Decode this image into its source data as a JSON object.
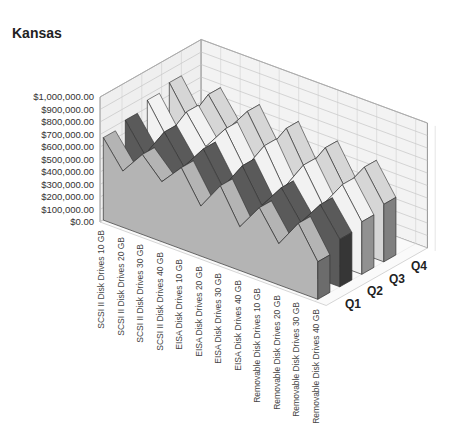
{
  "chart_data": {
    "type": "area",
    "subtype": "3d-area",
    "title": "Kansas",
    "xlabel": "",
    "ylabel": "",
    "zlabel": "",
    "ylim": [
      0,
      1000000
    ],
    "yticks": [
      "$1,000,000.00",
      "$900,000.00",
      "$800,000.00",
      "$700,000.00",
      "$600,000.00",
      "$500,000.00",
      "$400,000.00",
      "$300,000.00",
      "$200,000.00",
      "$100,000.00",
      "$0.00"
    ],
    "categories": [
      "SCSI II Disk Drives 10 GB",
      "SCSI II Disk Drives 20 GB",
      "SCSI II Disk Drives 30 GB",
      "SCSI II Disk Drives 40 GB",
      "EISA Disk Drives 10 GB",
      "EISA Disk Drives 20 GB",
      "EISA Disk Drives 30 GB",
      "EISA Disk Drives 40 GB",
      "Removable Disk Drives 10 GB",
      "Removable Disk Drives 20 GB",
      "Removable Disk Drives 30 GB",
      "Removable Disk Drives 40 GB"
    ],
    "series": [
      {
        "name": "Q1",
        "color": "#b4b4b4",
        "values": [
          660000,
          450000,
          640000,
          480000,
          650000,
          400000,
          620000,
          350000,
          560000,
          330000,
          550000,
          300000
        ]
      },
      {
        "name": "Q2",
        "color": "#5a5a5a",
        "values": [
          700000,
          480000,
          720000,
          500000,
          700000,
          450000,
          680000,
          420000,
          620000,
          400000,
          600000,
          380000
        ]
      },
      {
        "name": "Q3",
        "color": "#f2f2f2",
        "values": [
          760000,
          520000,
          780000,
          560000,
          760000,
          500000,
          740000,
          460000,
          700000,
          440000,
          660000,
          420000
        ]
      },
      {
        "name": "Q4",
        "color": "#d6d6d6",
        "values": [
          800000,
          560000,
          820000,
          600000,
          800000,
          540000,
          780000,
          500000,
          740000,
          480000,
          700000,
          460000
        ]
      }
    ],
    "grid": true,
    "legend": "none",
    "depth_labels": [
      "Q1",
      "Q2",
      "Q3",
      "Q4"
    ]
  },
  "page": {
    "title": "Kansas"
  }
}
